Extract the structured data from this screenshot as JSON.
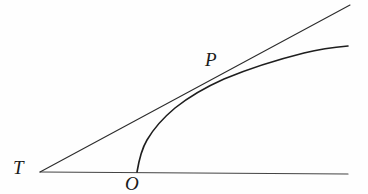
{
  "figure": {
    "background_color": "#fefefe",
    "ink_color": "#1e1e1e",
    "width": 368,
    "height": 194
  },
  "labels": {
    "vertex": "T",
    "origin": "O",
    "tangency": "P"
  },
  "chart_data": {
    "type": "line",
    "title": "",
    "xlabel": "",
    "ylabel": "",
    "grid": false,
    "legend": null,
    "xlim": [
      0,
      368
    ],
    "ylim": [
      194,
      0
    ],
    "annotations": [
      {
        "text": "T",
        "x": 22,
        "y": 169,
        "role": "line-intersection-vertex"
      },
      {
        "text": "O",
        "x": 134,
        "y": 185,
        "role": "curve-base-point"
      },
      {
        "text": "P",
        "x": 213,
        "y": 62,
        "role": "point-of-tangency"
      }
    ],
    "series": [
      {
        "name": "baseline",
        "role": "horizontal-axis-line",
        "type": "line",
        "x": [
          40,
          348
        ],
        "y": [
          172,
          174
        ]
      },
      {
        "name": "tangent",
        "role": "tangent-line-through-T-and-P",
        "type": "line",
        "x": [
          40,
          350
        ],
        "y": [
          172,
          5
        ]
      },
      {
        "name": "curve",
        "role": "concave-curve-rising-from-O",
        "type": "line",
        "x": [
          137,
          141,
          147,
          156,
          168,
          182,
          198,
          214,
          230,
          250,
          272,
          298,
          322,
          348
        ],
        "y": [
          172,
          155,
          141,
          127,
          114,
          103,
          94,
          86,
          79,
          71,
          63,
          55,
          50,
          47
        ]
      }
    ]
  },
  "paths": {
    "baseline": "M 40 172 L 348 174",
    "tangent": "M 40 172 L 350 5",
    "curve": "M 137 172 C 139 160 141 150 147 140 C 154 128 163 118 175 108 C 190 96 206 87 224 79 C 248 69 276 60 304 53 C 320 49 336 47 348 46"
  }
}
